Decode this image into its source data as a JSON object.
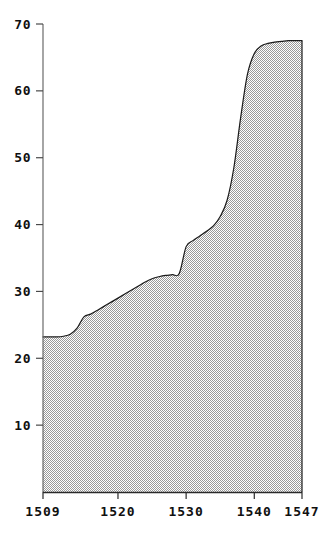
{
  "chart_data": {
    "type": "area",
    "title": "",
    "subtitle": "",
    "xlabel": "",
    "ylabel": "",
    "xlim": [
      1509,
      1547
    ],
    "ylim": [
      0,
      70
    ],
    "grid": false,
    "legend": null,
    "x_tick_labels": [
      "1509",
      "1520",
      "1530",
      "1540",
      "1547"
    ],
    "x_tick_values": [
      1509,
      1520,
      1530,
      1540,
      1547
    ],
    "y_tick_labels": [
      "10",
      "20",
      "30",
      "40",
      "50",
      "60",
      "70"
    ],
    "y_tick_values": [
      10,
      20,
      30,
      40,
      50,
      60,
      70
    ],
    "fill_pattern": "checkerboard-dither-gray",
    "fill_color": "#b4b4b4",
    "line_color": "#1a1a1a",
    "axis_color": "#555555",
    "background_color": "#ffffff",
    "x": [
      1509,
      1510,
      1511,
      1512,
      1513,
      1514,
      1515,
      1516,
      1517,
      1518,
      1519,
      1520,
      1521,
      1522,
      1523,
      1524,
      1525,
      1526,
      1527,
      1528,
      1529,
      1530,
      1531,
      1532,
      1533,
      1534,
      1535,
      1536,
      1537,
      1538,
      1539,
      1540,
      1541,
      1542,
      1543,
      1544,
      1545,
      1546,
      1547
    ],
    "values": [
      23.2,
      23.2,
      23.2,
      23.3,
      23.6,
      24.5,
      26.2,
      26.6,
      27.2,
      27.8,
      28.4,
      29.0,
      29.6,
      30.2,
      30.8,
      31.4,
      31.9,
      32.2,
      32.4,
      32.5,
      32.7,
      36.7,
      37.6,
      38.3,
      39.0,
      39.8,
      41.2,
      43.6,
      48.5,
      56.0,
      62.5,
      65.6,
      66.7,
      67.1,
      67.3,
      67.4,
      67.5,
      67.5,
      67.5
    ],
    "series": [
      {
        "name": "series-1",
        "values": [
          23.2,
          23.2,
          23.2,
          23.3,
          23.6,
          24.5,
          26.2,
          26.6,
          27.2,
          27.8,
          28.4,
          29.0,
          29.6,
          30.2,
          30.8,
          31.4,
          31.9,
          32.2,
          32.4,
          32.5,
          32.7,
          36.7,
          37.6,
          38.3,
          39.0,
          39.8,
          41.2,
          43.6,
          48.5,
          56.0,
          62.5,
          65.6,
          66.7,
          67.1,
          67.3,
          67.4,
          67.5,
          67.5,
          67.5
        ]
      }
    ],
    "annotations": []
  }
}
